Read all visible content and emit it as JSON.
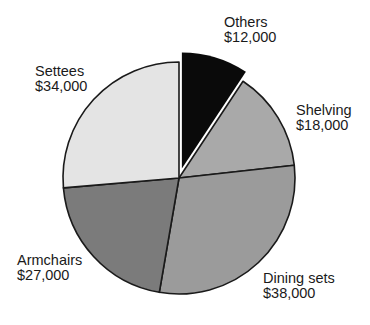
{
  "chart_data": {
    "type": "pie",
    "title": "",
    "start_angle_deg": 0,
    "direction": "clockwise",
    "currency": "$",
    "categories": [
      "Others",
      "Shelving",
      "Dining sets",
      "Armchairs",
      "Settees"
    ],
    "values": [
      12000,
      18000,
      38000,
      27000,
      34000
    ],
    "value_labels": [
      "$12,000",
      "$18,000",
      "$38,000",
      "$27,000",
      "$34,000"
    ],
    "colors": [
      "#0a0a0a",
      "#a9a9a9",
      "#9b9b9b",
      "#7b7b7b",
      "#e4e4e4"
    ],
    "exploded": [
      true,
      false,
      false,
      false,
      false
    ],
    "legend": "none",
    "data_labels": "outside"
  },
  "layout": {
    "center": [
      179,
      178
    ],
    "radius": 116,
    "explode_offset": 10,
    "stroke_color": "#1a1a1a"
  },
  "labels": [
    {
      "name": "Others",
      "value": "$12,000",
      "x": 224,
      "y": 15
    },
    {
      "name": "Shelving",
      "value": "$18,000",
      "x": 296,
      "y": 103
    },
    {
      "name": "Dining sets",
      "value": "$38,000",
      "x": 263,
      "y": 271
    },
    {
      "name": "Armchairs",
      "value": "$27,000",
      "x": 17,
      "y": 253
    },
    {
      "name": "Settees",
      "value": "$34,000",
      "x": 35,
      "y": 64
    }
  ]
}
